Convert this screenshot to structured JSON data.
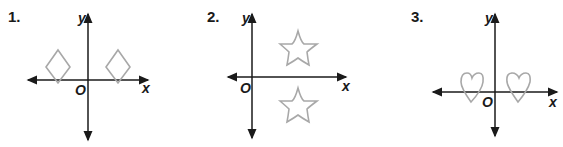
{
  "figures": [
    {
      "number": "1.",
      "axis_labels": {
        "x": "x",
        "y": "y",
        "origin": "O"
      },
      "shape": "diamond",
      "arrangement": "two diamonds reflected across y-axis, both sitting on x-axis"
    },
    {
      "number": "2.",
      "axis_labels": {
        "x": "x",
        "y": "y",
        "origin": "O"
      },
      "shape": "star",
      "arrangement": "two stars reflected across x-axis, in quadrants I and IV"
    },
    {
      "number": "3.",
      "axis_labels": {
        "x": "x",
        "y": "y",
        "origin": "O"
      },
      "shape": "heart",
      "arrangement": "two hearts reflected across y-axis, straddling x-axis"
    }
  ],
  "colors": {
    "axis": "#1a1a1a",
    "shape_stroke": "#a8a8a8"
  }
}
